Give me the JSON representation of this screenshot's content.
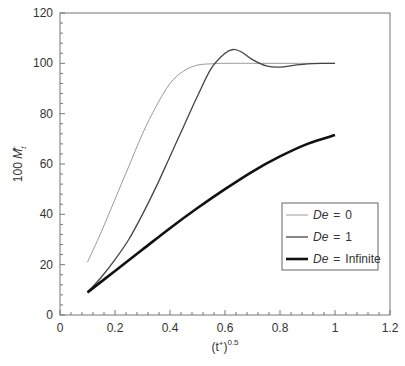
{
  "chart_data": {
    "type": "line",
    "title": "",
    "xlabel": "(t+)^0.5",
    "xlabel_base": "(t",
    "xlabel_sup_plus": "+",
    "xlabel_close": ")",
    "xlabel_exp": "0.5",
    "ylabel": "100 Mt+",
    "ylabel_prefix": "100 ",
    "ylabel_var": "M",
    "ylabel_sub": "t",
    "ylabel_sup": "+",
    "xlim": [
      0,
      1.2
    ],
    "ylim": [
      0,
      120
    ],
    "xticks": [
      "0",
      "0.2",
      "0.4",
      "0.6",
      "0.8",
      "1",
      "1.2"
    ],
    "yticks": [
      "0",
      "20",
      "40",
      "60",
      "80",
      "100",
      "120"
    ],
    "grid": false,
    "legend_position": "right-center inside plot",
    "series": [
      {
        "name": "De = 0",
        "legend_var": "De",
        "legend_eq": "=",
        "legend_val": "0",
        "color": "#9a9a9a",
        "width": 1,
        "x": [
          0.1,
          0.15,
          0.2,
          0.25,
          0.3,
          0.35,
          0.4,
          0.45,
          0.5,
          0.55,
          0.6,
          0.7,
          0.8,
          0.9,
          1.0
        ],
        "y": [
          21,
          33,
          46,
          59,
          72,
          83,
          92,
          97,
          99.3,
          99.8,
          100,
          100,
          100,
          100,
          100
        ]
      },
      {
        "name": "De = 1",
        "legend_var": "De",
        "legend_eq": "=",
        "legend_val": "1",
        "color": "#444444",
        "width": 1.3,
        "x": [
          0.1,
          0.15,
          0.2,
          0.25,
          0.3,
          0.35,
          0.4,
          0.45,
          0.5,
          0.55,
          0.6,
          0.63,
          0.66,
          0.7,
          0.75,
          0.8,
          0.85,
          0.9,
          0.95,
          1.0
        ],
        "y": [
          9,
          15,
          22,
          30,
          40,
          51,
          63,
          75,
          87,
          98,
          104,
          105.5,
          104.5,
          101.5,
          99,
          98.5,
          99.2,
          99.8,
          100,
          100
        ]
      },
      {
        "name": "De = Infinite",
        "legend_var": "De",
        "legend_eq": "=",
        "legend_val": "Infinite",
        "color": "#111111",
        "width": 2.6,
        "x": [
          0.1,
          0.2,
          0.3,
          0.4,
          0.5,
          0.6,
          0.7,
          0.8,
          0.9,
          1.0
        ],
        "y": [
          9,
          17.5,
          26,
          34.5,
          42.5,
          50,
          57,
          63,
          68,
          71.5
        ]
      }
    ]
  }
}
